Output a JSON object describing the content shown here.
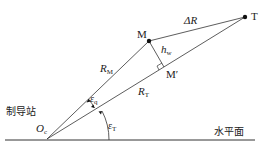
{
  "diagram": {
    "points": {
      "M": {
        "label": "M"
      },
      "T": {
        "label": "T"
      },
      "M_prime": {
        "label": "M",
        "prime": "′"
      },
      "Oc": {
        "label": "O",
        "sub": "c"
      }
    },
    "segments": {
      "delta_R": {
        "label": "ΔR"
      },
      "R_M": {
        "label": "R",
        "sub": "M"
      },
      "R_T": {
        "label": "R",
        "sub": "T"
      },
      "h_w": {
        "label": "h",
        "sub": "w"
      }
    },
    "angles": {
      "eps_q": {
        "label": "ε",
        "sub": "q"
      },
      "eps_T": {
        "label": "ε",
        "sub": "T"
      }
    },
    "text": {
      "station": "制导站",
      "horizontal_plane": "水平面"
    }
  }
}
